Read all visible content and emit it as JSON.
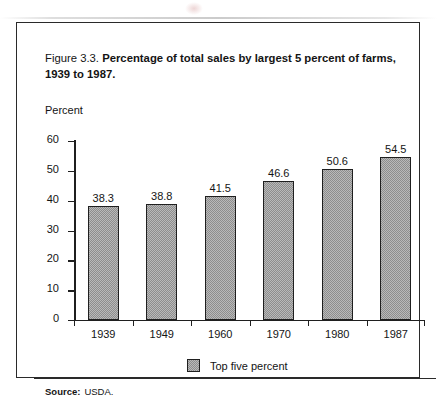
{
  "figure": {
    "title_lead": "Figure 3.3.",
    "title_main": "Percentage of total sales by largest 5 percent of farms, 1939 to 1987.",
    "source_label": "Source:",
    "source_value": "USDA."
  },
  "chart_data": {
    "type": "bar",
    "title": "Figure 3.3.  Percentage of total sales by largest 5 percent of farms, 1939 to 1987.",
    "xlabel": "",
    "ylabel": "Percent",
    "categories": [
      "1939",
      "1949",
      "1960",
      "1970",
      "1980",
      "1987"
    ],
    "values": [
      38.3,
      38.8,
      41.5,
      46.6,
      50.6,
      54.5
    ],
    "value_labels": [
      "38.3",
      "38.8",
      "41.5",
      "46.6",
      "50.6",
      "54.5"
    ],
    "series": [
      {
        "name": "Top five percent",
        "values": [
          38.3,
          38.8,
          41.5,
          46.6,
          50.6,
          54.5
        ]
      }
    ],
    "ylim": [
      0,
      60
    ],
    "yticks": [
      0,
      10,
      20,
      30,
      40,
      50,
      60
    ],
    "ytick_labels": [
      "0",
      "10",
      "20",
      "30",
      "40",
      "50",
      "60"
    ],
    "grid": false,
    "legend_position": "bottom-center",
    "legend_entries": [
      "Top five percent"
    ],
    "bar_fill": "#b9b9b9",
    "bar_edge": "#1f1f1f"
  }
}
